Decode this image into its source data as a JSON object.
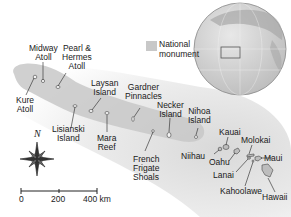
{
  "legend": {
    "swatch_color": "#c8c8c8",
    "line1": "National",
    "line2": "monument"
  },
  "labels": {
    "midway": [
      "Midway",
      "Atoll"
    ],
    "pearl": [
      "Pearl &",
      "Hermes",
      "Atoll"
    ],
    "kure": [
      "Kure",
      "Atoll"
    ],
    "laysan": [
      "Laysan",
      "Island"
    ],
    "gardner": [
      "Gardner",
      "Pinnacles"
    ],
    "lisianski": [
      "Lisianski",
      "Island"
    ],
    "mara": [
      "Mara",
      "Reef"
    ],
    "french": [
      "French",
      "Frigate",
      "Shoals"
    ],
    "necker": [
      "Necker",
      "Island"
    ],
    "nihoa": [
      "Nihoa",
      "Island"
    ],
    "kauai": "Kauai",
    "niihau": "Niihau",
    "oahu": "Oahu",
    "molokai": "Molokai",
    "maui": "Maui",
    "lanai": "Lanai",
    "kahoolawe": "Kahoolawe",
    "hawaii": "Hawaii"
  },
  "compass": {
    "north_label": "N"
  },
  "scale": {
    "ticks": [
      "0",
      "200",
      "400 km"
    ]
  },
  "colors": {
    "monument": "#c8c8c8",
    "ocean_shade": "#e2e2e2",
    "land": "#bdbdbd",
    "globe": "#d6d6d6"
  }
}
